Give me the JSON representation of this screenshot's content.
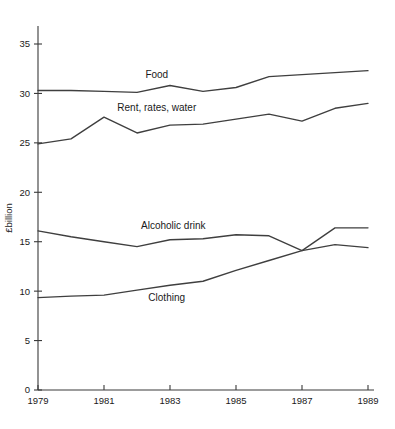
{
  "chart_data": {
    "type": "line",
    "title": "",
    "xlabel": "",
    "ylabel": "£billion",
    "x": [
      1979,
      1980,
      1981,
      1982,
      1983,
      1984,
      1985,
      1986,
      1987,
      1988,
      1989
    ],
    "xlim": [
      1979,
      1989
    ],
    "ylim": [
      0,
      36.5
    ],
    "grid": false,
    "legend_position": "inline-labels",
    "xticks": [
      "1979",
      "1981",
      "1983",
      "1985",
      "1987",
      "1989"
    ],
    "xtick_values": [
      1979,
      1981,
      1983,
      1985,
      1987,
      1989
    ],
    "yticks": [
      "0",
      "5",
      "10",
      "15",
      "20",
      "25",
      "30",
      "35"
    ],
    "ytick_values": [
      0,
      5,
      10,
      15,
      20,
      25,
      30,
      35
    ],
    "series": [
      {
        "name": "Food",
        "label": "Food",
        "label_x": 1982.6,
        "label_y": 31.6,
        "color": "#3f3f3f",
        "values": [
          30.3,
          30.3,
          30.2,
          30.1,
          30.8,
          30.2,
          30.6,
          31.7,
          31.9,
          32.1,
          32.3
        ]
      },
      {
        "name": "Rent, rates, water",
        "label": "Rent, rates, water",
        "label_x": 1982.6,
        "label_y": 28.2,
        "color": "#3f3f3f",
        "values": [
          24.9,
          25.4,
          27.6,
          26.0,
          26.8,
          26.9,
          27.4,
          27.9,
          27.2,
          28.5,
          29.0
        ]
      },
      {
        "name": "Alcoholic drink",
        "label": "Alcoholic drink",
        "label_x": 1983.1,
        "label_y": 16.3,
        "color": "#3f3f3f",
        "values": [
          16.1,
          15.5,
          15.0,
          14.5,
          15.2,
          15.3,
          15.7,
          15.6,
          14.1,
          16.4,
          16.4
        ]
      },
      {
        "name": "Clothing",
        "label": "Clothing",
        "label_x": 1982.9,
        "label_y": 9.0,
        "color": "#3f3f3f",
        "values": [
          9.35,
          9.5,
          9.6,
          10.1,
          10.6,
          11.0,
          12.1,
          13.1,
          14.1,
          14.7,
          14.4
        ]
      }
    ]
  },
  "axis": {
    "y_title": "£billion",
    "axis_color": "#3a3a3a"
  }
}
